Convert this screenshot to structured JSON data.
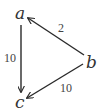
{
  "diagram": {
    "type": "directed-graph",
    "nodes": [
      {
        "id": "a",
        "label": "a",
        "x": 20,
        "y": 18
      },
      {
        "id": "b",
        "label": "b",
        "x": 92,
        "y": 66
      },
      {
        "id": "c",
        "label": "c",
        "x": 20,
        "y": 107
      }
    ],
    "edges": [
      {
        "from": "b",
        "to": "a",
        "weight": "2"
      },
      {
        "from": "a",
        "to": "c",
        "weight": "10"
      },
      {
        "from": "b",
        "to": "c",
        "weight": "10"
      }
    ],
    "colors": {
      "line": "#2a2a2a",
      "text": "#333333",
      "background": "#ffffff"
    }
  }
}
